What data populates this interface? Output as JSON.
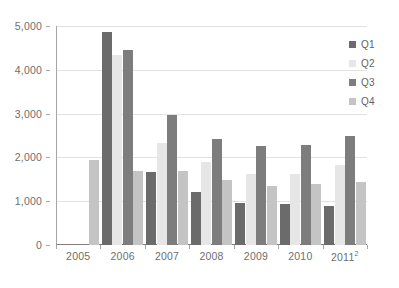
{
  "chart_data": {
    "type": "bar",
    "title": "",
    "subtitle": "",
    "xlabel": "",
    "ylabel": "",
    "categories": [
      "2005",
      "2006",
      "2007",
      "2008",
      "2009",
      "2010",
      "2011"
    ],
    "category_labels": [
      "2005",
      "2006",
      "2007",
      "2008",
      "2009",
      "2010",
      "2011"
    ],
    "category_footnotes": [
      "",
      "",
      "",
      "",
      "",
      "",
      "2"
    ],
    "series": [
      {
        "name": "Q1",
        "color": "#6b6b6b",
        "values": [
          null,
          4860,
          1660,
          1220,
          960,
          930,
          880
        ]
      },
      {
        "name": "Q2",
        "color": "#e6e6e6",
        "values": [
          null,
          4340,
          2340,
          1900,
          1610,
          1610,
          1820
        ]
      },
      {
        "name": "Q3",
        "color": "#7d7d7d",
        "values": [
          null,
          4460,
          2960,
          2430,
          2250,
          2280,
          2490
        ]
      },
      {
        "name": "Q4",
        "color": "#c4c4c4",
        "values": [
          1930,
          1700,
          1690,
          1490,
          1340,
          1390,
          1440
        ]
      }
    ],
    "ylim": [
      0,
      5000
    ],
    "yticks": [
      0,
      1000,
      2000,
      3000,
      4000,
      5000
    ],
    "ytick_labels": [
      "0",
      "1,000",
      "2,000",
      "3,000",
      "4,000",
      "5,000"
    ],
    "grid": true,
    "grid_axis": "y",
    "legend_position": "right",
    "legend_entries": [
      "Q1",
      "Q2",
      "Q3",
      "Q4"
    ],
    "background_color": "#ffffff",
    "gridline_color": "#e2e2e2",
    "axis_color": "#a6a6a6",
    "tick_label_color": "#6e6e6e"
  }
}
